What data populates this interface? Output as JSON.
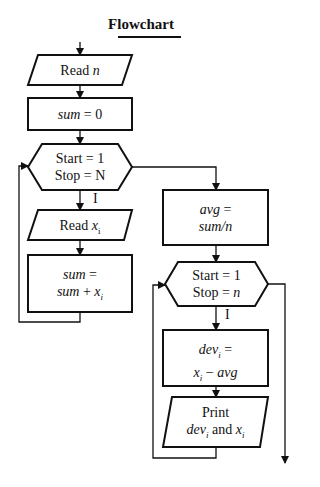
{
  "title": "Flowchart",
  "left_column": {
    "read_n": {
      "prefix": "Read ",
      "var": "n"
    },
    "init_sum": {
      "var": "sum",
      "rest": " = 0"
    },
    "loop1": {
      "line1": "Start = 1",
      "line2": "Stop = N",
      "iter_label": "I"
    },
    "read_xi": {
      "prefix": "Read ",
      "var": "x",
      "sub": "i"
    },
    "accumulate": {
      "line1_var": "sum",
      "line1_rest": " =",
      "line2_var": "sum",
      "line2_op": " + ",
      "line2_var2": "x",
      "line2_sub": "i"
    }
  },
  "right_column": {
    "average": {
      "line1_var": "avg",
      "line1_rest": " =",
      "line2": "sum/n"
    },
    "loop2": {
      "line1": "Start = 1",
      "line2_prefix": "Stop = ",
      "line2_var": "n",
      "iter_label": "I"
    },
    "deviation": {
      "line1_var": "dev",
      "line1_sub": "i",
      "line1_rest": " =",
      "line2_var": "x",
      "line2_sub": "i",
      "line2_op": " − ",
      "line2_var2": "avg"
    },
    "print": {
      "line1": "Print",
      "line2_var": "dev",
      "line2_sub": "i",
      "line2_mid": " and ",
      "line2_var2": "x",
      "line2_sub2": "i"
    }
  },
  "colors": {
    "stroke": "#111111",
    "background": "#ffffff"
  }
}
